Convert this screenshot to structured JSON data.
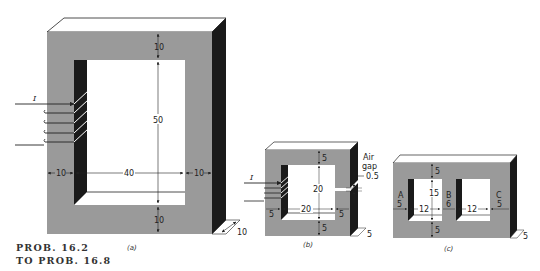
{
  "title": {
    "line1": "PROB. 16.2",
    "line2": "TO PROB. 16.8"
  },
  "colors": {
    "core_face": "#9a9a9a",
    "core_top": "#ffffff",
    "core_side": "#1a1a1a",
    "window": "#ffffff",
    "line": "#222222"
  },
  "figures": {
    "a": {
      "caption": "(a)",
      "current_label": "I",
      "dims": {
        "top": "10",
        "height": "50",
        "left": "10",
        "width": "40",
        "right": "10",
        "bottom": "10",
        "depth": "10"
      }
    },
    "b": {
      "caption": "(b)",
      "current_label": "I",
      "air_gap_label_1": "Air",
      "air_gap_label_2": "gap",
      "air_gap_value": "0.5",
      "dims": {
        "top": "5",
        "height": "20",
        "left": "5",
        "width": "20",
        "right": "5",
        "bottom": "5",
        "depth": "5"
      }
    },
    "c": {
      "caption": "(c)",
      "legs": [
        "A",
        "B",
        "C"
      ],
      "dims": {
        "top": "5",
        "height": "15",
        "left": "5",
        "window1": "12",
        "middle": "6",
        "window2": "12",
        "right": "5",
        "bottom": "5",
        "depth": "5"
      }
    }
  }
}
